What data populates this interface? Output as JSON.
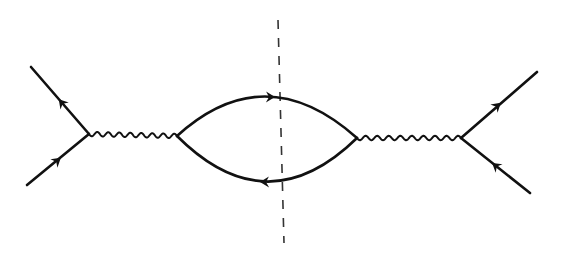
{
  "diagram": {
    "type": "feynman-diagram",
    "canvas": {
      "width": 566,
      "height": 257,
      "background": "#ffffff"
    },
    "style": {
      "line_color": "#111111",
      "line_width": 2.6,
      "wavy_width": 2.0,
      "cut_color": "#333333",
      "cut_width": 1.6,
      "cut_dash": "9,9"
    },
    "vertices": [
      {
        "id": "v1",
        "x": 89,
        "y": 134
      },
      {
        "id": "v2",
        "x": 177,
        "y": 136
      },
      {
        "id": "v3",
        "x": 357,
        "y": 138
      },
      {
        "id": "v4",
        "x": 461,
        "y": 138
      }
    ],
    "external_lines": [
      {
        "id": "in-upper-left",
        "from": [
          31,
          67
        ],
        "to": [
          89,
          134
        ],
        "arrow_at": [
          62,
          103
        ],
        "arrow_direction": "toward-upper-left"
      },
      {
        "id": "in-lower-left",
        "from": [
          27,
          185
        ],
        "to": [
          89,
          134
        ],
        "arrow_at": [
          57,
          161
        ],
        "arrow_direction": "toward-vertex"
      },
      {
        "id": "out-upper-right",
        "from": [
          461,
          138
        ],
        "to": [
          537,
          72
        ],
        "arrow_at": [
          497,
          106
        ],
        "arrow_direction": "away-from-vertex"
      },
      {
        "id": "out-lower-right",
        "from": [
          530,
          193
        ],
        "to": [
          461,
          138
        ],
        "arrow_at": [
          496,
          166
        ],
        "arrow_direction": "toward-vertex"
      }
    ],
    "boson_propagators": [
      {
        "id": "photon-left",
        "from": [
          89,
          134
        ],
        "to": [
          177,
          136
        ],
        "waves": 8,
        "amplitude": 2.2
      },
      {
        "id": "photon-right",
        "from": [
          357,
          138
        ],
        "to": [
          461,
          138
        ],
        "waves": 9,
        "amplitude": 2.2
      }
    ],
    "fermion_loop": {
      "upper_arc": {
        "from": [
          177,
          136
        ],
        "control": [
          265,
          56
        ],
        "to": [
          357,
          138
        ],
        "arrow_at": [
          270,
          97
        ],
        "arrow_direction": "right"
      },
      "lower_arc": {
        "from": [
          357,
          138
        ],
        "control": [
          267,
          226
        ],
        "to": [
          177,
          136
        ],
        "arrow_at": [
          265,
          182
        ],
        "arrow_direction": "left"
      }
    },
    "cut_line": {
      "from": [
        278,
        20
      ],
      "to": [
        284,
        243
      ],
      "style": "dashed"
    },
    "labels": []
  }
}
